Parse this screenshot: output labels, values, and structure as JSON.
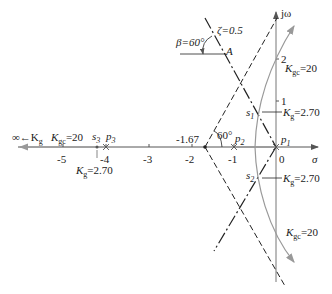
{
  "diagram": {
    "type": "root-locus",
    "axes": {
      "real_label": "σ",
      "imag_label": "jω",
      "real_ticks": [
        "-5",
        "-4",
        "-3",
        "-2",
        "-1",
        "0"
      ],
      "imag_ticks": [
        "2",
        "1"
      ]
    },
    "poles": [
      {
        "name": "p1",
        "label": "p",
        "sub": "1",
        "value": 0
      },
      {
        "name": "p2",
        "label": "p",
        "sub": "2",
        "value": -1
      },
      {
        "name": "p3",
        "label": "p",
        "sub": "3",
        "value": -4
      }
    ],
    "centroid": {
      "label": "-1.67",
      "value": -1.67
    },
    "asymptote_angle": "60°",
    "damping": {
      "zeta_label": "ζ=0.5",
      "beta_label": "β=60°",
      "point_label": "A"
    },
    "closed_loop_points": [
      {
        "name": "s1",
        "label": "s",
        "sub": "1"
      },
      {
        "name": "s2",
        "label": "s",
        "sub": "2"
      },
      {
        "name": "s3",
        "label": "s",
        "sub": "3"
      }
    ],
    "gain_labels": {
      "kg_infinity": "∞←K",
      "kg_infinity_sub": "g",
      "kgc_20": "=20",
      "kg_270": "=2.70",
      "K": "K",
      "g_sub": "g",
      "gc_sub": "gc"
    }
  }
}
